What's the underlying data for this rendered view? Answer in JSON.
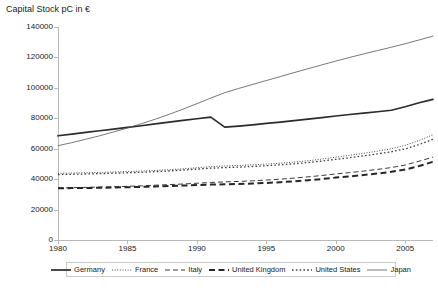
{
  "chart_data": {
    "type": "line",
    "title": "Capital Stock pC in €",
    "xlabel": "",
    "ylabel": "",
    "ylim": [
      0,
      140000
    ],
    "xlim": [
      1980,
      2007
    ],
    "grid": false,
    "legend_position": "bottom",
    "ytick_labels": [
      "0",
      "20000",
      "40000",
      "60000",
      "80000",
      "100000",
      "120000",
      "140000"
    ],
    "ytick_values": [
      0,
      20000,
      40000,
      60000,
      80000,
      100000,
      120000,
      140000
    ],
    "xtick_labels": [
      "1980",
      "1985",
      "1990",
      "1995",
      "2000",
      "2005"
    ],
    "xtick_values": [
      1980,
      1985,
      1990,
      1995,
      2000,
      2005
    ],
    "x": [
      1980,
      1981,
      1982,
      1983,
      1984,
      1985,
      1986,
      1987,
      1988,
      1989,
      1990,
      1991,
      1992,
      1993,
      1994,
      1995,
      1996,
      1997,
      1998,
      1999,
      2000,
      2001,
      2002,
      2003,
      2004,
      2005,
      2006,
      2007
    ],
    "series": [
      {
        "name": "Germany",
        "style": "solid-bold",
        "color": "#2b2b2b",
        "values": [
          68500,
          69600,
          70700,
          71800,
          72900,
          74000,
          75100,
          76300,
          77500,
          78600,
          79700,
          80800,
          74200,
          74900,
          75700,
          76600,
          77500,
          78400,
          79400,
          80400,
          81500,
          82500,
          83400,
          84300,
          85300,
          87600,
          90200,
          92400
        ]
      },
      {
        "name": "France",
        "style": "dotted-fine",
        "color": "#4a4a4a",
        "values": [
          43800,
          44000,
          44200,
          44400,
          44700,
          45000,
          45300,
          45700,
          46200,
          46800,
          47500,
          48200,
          48700,
          49000,
          49400,
          49900,
          50500,
          51200,
          52100,
          53200,
          54400,
          55700,
          57000,
          58400,
          60000,
          62200,
          65400,
          69200
        ]
      },
      {
        "name": "Italy",
        "style": "dashed-thin",
        "color": "#3a3a3a",
        "values": [
          34200,
          34400,
          34600,
          34800,
          35000,
          35300,
          35600,
          36000,
          36400,
          36800,
          37300,
          37800,
          38200,
          38500,
          38900,
          39400,
          40000,
          40700,
          41500,
          42400,
          43400,
          44300,
          45300,
          46400,
          47600,
          49300,
          51800,
          54500
        ]
      },
      {
        "name": "United Kingdom",
        "style": "dashed-bold",
        "color": "#262626",
        "values": [
          34000,
          34100,
          34200,
          34300,
          34500,
          34700,
          34900,
          35200,
          35500,
          35800,
          36100,
          36400,
          36600,
          36800,
          37100,
          37500,
          38000,
          38600,
          39300,
          40100,
          41000,
          41800,
          42700,
          43700,
          44800,
          46300,
          48600,
          51400
        ]
      },
      {
        "name": "United States",
        "style": "dotted-square",
        "color": "#3f3f3f",
        "values": [
          43000,
          43200,
          43400,
          43600,
          43900,
          44200,
          44500,
          44900,
          45400,
          46000,
          46600,
          47200,
          47600,
          47900,
          48300,
          48800,
          49400,
          50100,
          50900,
          51900,
          53000,
          54100,
          55300,
          56600,
          58000,
          59900,
          62700,
          66200
        ]
      },
      {
        "name": "Japan",
        "style": "solid-thin",
        "color": "#555555",
        "values": [
          62000,
          64000,
          66200,
          68500,
          71000,
          73600,
          76400,
          79400,
          82600,
          86000,
          89600,
          93300,
          96800,
          99600,
          102200,
          104800,
          107400,
          110000,
          112600,
          115100,
          117600,
          120000,
          122300,
          124500,
          126700,
          129000,
          131500,
          134000
        ]
      }
    ]
  },
  "legend": {
    "items": [
      {
        "label": "Germany",
        "style": "solid-bold"
      },
      {
        "label": "France",
        "style": "dotted-fine"
      },
      {
        "label": "Italy",
        "style": "dashed-thin"
      },
      {
        "label": "United Kingdom",
        "style": "dashed-bold"
      },
      {
        "label": "United States",
        "style": "dotted-square"
      },
      {
        "label": "Japan",
        "style": "solid-thin"
      }
    ]
  }
}
